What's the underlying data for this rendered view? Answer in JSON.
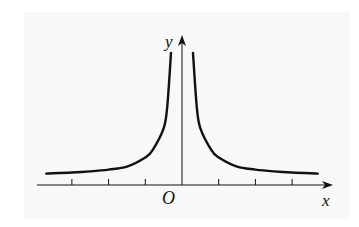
{
  "figure": {
    "type": "function-graph",
    "axes": {
      "x_label": "x",
      "y_label": "y",
      "origin_label": "O"
    },
    "colors": {
      "panel": "#f8f8f8",
      "ink": "#111111"
    }
  },
  "chart_data": {
    "type": "line",
    "title": "",
    "xlabel": "x",
    "ylabel": "y",
    "origin_label": "O",
    "grid": false,
    "legend": "none",
    "x_ticks_unlabeled": [
      -3,
      -2,
      -1,
      1,
      2,
      3
    ],
    "xlim": [
      -4,
      4.2
    ],
    "ylim": [
      0,
      4.1
    ],
    "asymptotes": {
      "vertical": "x = 0",
      "horizontal": "y ≈ 0.3"
    },
    "symmetry": "even (symmetric about y-axis)",
    "series": [
      {
        "name": "right-branch",
        "x": [
          0.3,
          0.4,
          0.5,
          0.8,
          1.0,
          1.5,
          2.0,
          2.5,
          3.0,
          3.7
        ],
        "y": [
          3.6,
          2.15,
          1.55,
          0.95,
          0.75,
          0.5,
          0.42,
          0.37,
          0.34,
          0.31
        ]
      },
      {
        "name": "left-branch",
        "x": [
          -3.7,
          -3.0,
          -2.5,
          -2.0,
          -1.5,
          -1.0,
          -0.8,
          -0.5,
          -0.4,
          -0.3
        ],
        "y": [
          0.31,
          0.34,
          0.37,
          0.42,
          0.5,
          0.75,
          0.95,
          1.55,
          2.15,
          3.6
        ]
      }
    ]
  }
}
